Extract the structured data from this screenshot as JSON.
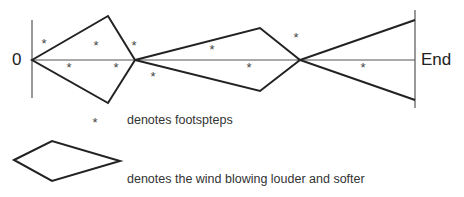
{
  "diagram": {
    "start_label": "0",
    "end_label": "End",
    "footstep_symbol": "*",
    "footsteps": [
      {
        "x": 44,
        "y": 43
      },
      {
        "x": 96,
        "y": 45
      },
      {
        "x": 134,
        "y": 45
      },
      {
        "x": 69,
        "y": 67
      },
      {
        "x": 116,
        "y": 67
      },
      {
        "x": 153,
        "y": 76
      },
      {
        "x": 212,
        "y": 49
      },
      {
        "x": 249,
        "y": 67
      },
      {
        "x": 296,
        "y": 37
      },
      {
        "x": 363,
        "y": 67
      }
    ],
    "shapes": [
      {
        "type": "diamond",
        "points": "32,60 108,16 135,60 108,103"
      },
      {
        "type": "diamond",
        "points": "135,60 260,28 300,60 260,91"
      },
      {
        "type": "fan",
        "points": "415,20 300,60 415,100"
      }
    ]
  },
  "legend": {
    "items": [
      {
        "symbol": "*",
        "label": "denotes footspteps"
      },
      {
        "symbol": "diamond",
        "label": "denotes the wind blowing louder and softer"
      }
    ]
  },
  "colors": {
    "line": "#222222",
    "axis": "#555555"
  }
}
